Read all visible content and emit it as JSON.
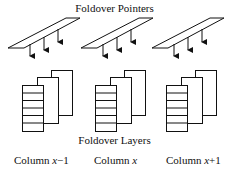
{
  "diagram": {
    "title_top": "Foldover Pointers",
    "title_bottom": "Foldover Layers",
    "columns": [
      {
        "label_prefix": "Column ",
        "label_var": "x",
        "label_suffix": "−1"
      },
      {
        "label_prefix": "Column ",
        "label_var": "x",
        "label_suffix": ""
      },
      {
        "label_prefix": "Column ",
        "label_var": "x",
        "label_suffix": "+1"
      }
    ],
    "pointer_arrows_per_column": 3,
    "layers_per_column": 3,
    "rows_in_front_layer": 6,
    "colors": {
      "stroke": "#111111",
      "background": "#ffffff"
    }
  }
}
